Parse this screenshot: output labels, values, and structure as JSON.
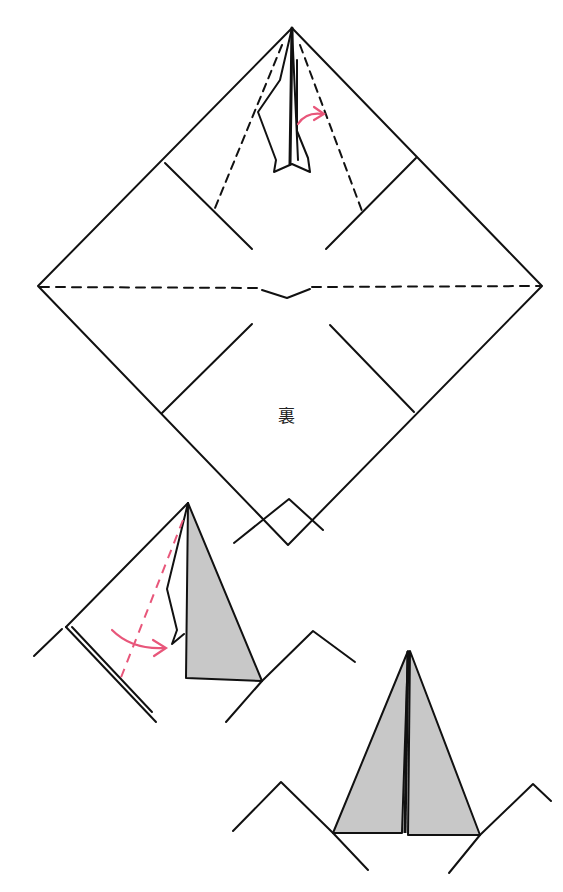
{
  "diagram": {
    "type": "origami-instruction",
    "colors": {
      "line": "#111111",
      "fold_arrow": "#e8567a",
      "shaded_paper": "#c8c8c8",
      "background": "#ffffff"
    },
    "steps": [
      {
        "id": "step-a",
        "description": "Square paper shown as diamond, back side up, with valley-fold dashed lines and a narrow folded point at top; pink arrow indicates folding",
        "label": "裏",
        "label_meaning": "back side"
      },
      {
        "id": "step-b",
        "description": "Close-up of top point: right flap shaded, pink dashed fold line with curved arrow folding left flap to the right"
      },
      {
        "id": "step-c",
        "description": "Result: narrow kite-shaped point with both shaded flaps meeting at center"
      }
    ]
  }
}
